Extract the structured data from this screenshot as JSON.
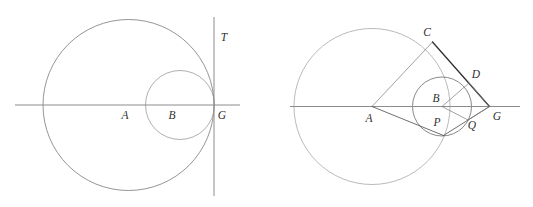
{
  "document": {
    "title": "Two circle-tangency geometric figures",
    "background_color": "#ffffff",
    "width": 533,
    "height": 207
  },
  "style": {
    "stroke_light": "#9a9a9a",
    "stroke_medium": "#7a7a7a",
    "stroke_dark": "#4a4a4a",
    "stroke_darkest": "#303030",
    "label_color": "#303030",
    "axis_color": "#8c8c8c",
    "thin_width": 0.7,
    "medium_width": 0.8,
    "thick_width": 1.3
  },
  "figures": [
    {
      "id": "left-figure",
      "name": "internally-tangent-circles-with-tangent-line",
      "axis": {
        "name": "horizontal-axis",
        "x1": 15,
        "y1": 105,
        "x2": 240,
        "y2": 105
      },
      "tangent_line": {
        "name": "vertical-tangent-line-T",
        "x1": 214,
        "y1": 17,
        "x2": 214,
        "y2": 196
      },
      "circles": [
        {
          "name": "large-circle-A",
          "cx": 128.5,
          "cy": 105,
          "r": 85.5,
          "stroke": "#7a7a7a"
        },
        {
          "name": "small-circle-B",
          "cx": 180,
          "cy": 105,
          "r": 34.5,
          "stroke": "#9a9a9a"
        }
      ],
      "labels": [
        {
          "name": "label-A",
          "text": "A",
          "x": 125,
          "y": 116
        },
        {
          "name": "label-B",
          "text": "B",
          "x": 172,
          "y": 116
        },
        {
          "name": "label-G",
          "text": "G",
          "x": 222,
          "y": 116
        },
        {
          "name": "label-T",
          "text": "T",
          "x": 224,
          "y": 38
        }
      ]
    },
    {
      "id": "right-figure",
      "name": "two-circles-with-external-tangent-lines",
      "axis": {
        "name": "horizontal-axis",
        "x1": 290,
        "y1": 106.5,
        "x2": 520,
        "y2": 106.5
      },
      "circles": [
        {
          "name": "large-circle-A",
          "cx": 372,
          "cy": 106.5,
          "r": 78,
          "stroke": "#a8a8a8"
        },
        {
          "name": "small-circle-B",
          "cx": 442,
          "cy": 106.5,
          "r": 29.5,
          "stroke": "#6a6a6a"
        }
      ],
      "points": {
        "A": {
          "x": 372,
          "y": 106.5
        },
        "B": {
          "x": 442,
          "y": 106.5
        },
        "C": {
          "x": 432.5,
          "y": 42
        },
        "D": {
          "x": 469,
          "y": 83
        },
        "P": {
          "x": 443.5,
          "y": 135.5
        },
        "Q": {
          "x": 468,
          "y": 120
        },
        "G": {
          "x": 489.5,
          "y": 106.5
        }
      },
      "segments": [
        {
          "name": "segment-A-C",
          "from": "A",
          "to": "C",
          "weight": "thin"
        },
        {
          "name": "segment-C-G",
          "from": "C",
          "to": "G",
          "weight": "thick"
        },
        {
          "name": "segment-A-P",
          "from": "A",
          "to": "P",
          "weight": "medium"
        },
        {
          "name": "segment-P-G",
          "from": "P",
          "to": "G",
          "weight": "medium"
        },
        {
          "name": "segment-B-D",
          "from": "B",
          "to": "D",
          "weight": "thin"
        },
        {
          "name": "segment-B-Q",
          "from": "B",
          "to": "Q",
          "weight": "thin"
        },
        {
          "name": "segment-D-G",
          "from": "D",
          "to": "G",
          "weight": "thin"
        },
        {
          "name": "segment-Q-G",
          "from": "Q",
          "to": "G",
          "weight": "thin"
        }
      ],
      "labels": [
        {
          "name": "label-A",
          "text": "A",
          "x": 369,
          "y": 119
        },
        {
          "name": "label-B",
          "text": "B",
          "x": 436,
          "y": 99
        },
        {
          "name": "label-C",
          "text": "C",
          "x": 427,
          "y": 33
        },
        {
          "name": "label-D",
          "text": "D",
          "x": 476,
          "y": 75
        },
        {
          "name": "label-P",
          "text": "P",
          "x": 437,
          "y": 123
        },
        {
          "name": "label-Q",
          "text": "Q",
          "x": 472,
          "y": 126
        },
        {
          "name": "label-G",
          "text": "G",
          "x": 497,
          "y": 117
        }
      ]
    }
  ]
}
